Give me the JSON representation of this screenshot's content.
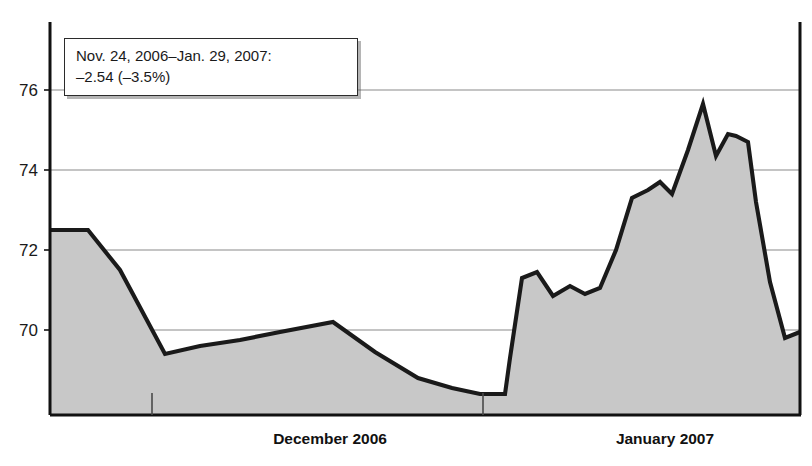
{
  "chart_data": {
    "type": "area",
    "title": "",
    "subtitle": "",
    "xlabel": "",
    "ylabel": "",
    "ylim": [
      68.2,
      76.9
    ],
    "yticks": [
      70,
      72,
      74,
      76
    ],
    "ytick_labels": [
      "70",
      "72",
      "74",
      "76"
    ],
    "grid": true,
    "legend": null,
    "x_axis_labels": [
      "December 2006",
      "January 2007"
    ],
    "x_axis_label_positions": [
      330,
      665
    ],
    "x_month_ticks": [
      152,
      483
    ],
    "annotations": [
      {
        "name": "range-callout",
        "line1": "Nov. 24, 2006–Jan. 29, 2007:",
        "line2": "–2.54 (–3.5%)"
      }
    ],
    "series": [
      {
        "name": "price",
        "fill_color": "#c8c8c8",
        "line_color": "#1a1a1a",
        "x": [
          50,
          88,
          120,
          165,
          200,
          240,
          280,
          333,
          375,
          418,
          452,
          480,
          505,
          510,
          522,
          537,
          553,
          570,
          585,
          600,
          616,
          632,
          648,
          660,
          672,
          688,
          703,
          716,
          728,
          736,
          748,
          756,
          770,
          785,
          800
        ],
        "values": [
          72.5,
          72.5,
          71.5,
          69.4,
          69.6,
          69.75,
          69.95,
          70.2,
          69.45,
          68.8,
          68.55,
          68.4,
          68.4,
          69.3,
          71.3,
          71.45,
          70.85,
          71.1,
          70.9,
          71.05,
          72.0,
          73.3,
          73.5,
          73.7,
          73.4,
          74.5,
          75.65,
          74.35,
          74.9,
          74.85,
          74.7,
          73.2,
          71.2,
          69.8,
          69.95
        ]
      }
    ]
  },
  "callout": {
    "line1": "Nov. 24, 2006–Jan. 29, 2007:",
    "line2": "–2.54 (–3.5%)"
  },
  "axis": {
    "y_labels": [
      "76",
      "74",
      "72",
      "70"
    ],
    "x_labels": [
      "December 2006",
      "January 2007"
    ]
  },
  "colors": {
    "area_fill": "#c8c8c8",
    "line": "#1a1a1a",
    "gridline": "#8a8a8a",
    "axis": "#111111",
    "background": "#ffffff"
  }
}
